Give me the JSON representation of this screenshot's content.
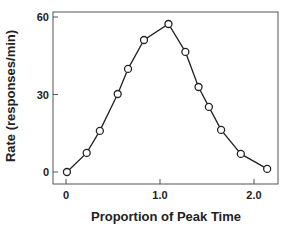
{
  "chart_data": {
    "type": "line",
    "title": "",
    "xlabel": "Proportion of Peak Time",
    "ylabel": "Rate (responses/min)",
    "xlim": [
      -0.14,
      2.27
    ],
    "ylim": [
      -4.6,
      61.9
    ],
    "xticks": [
      0,
      1.0,
      2.0
    ],
    "xtick_labels": [
      "0",
      "1.0",
      "2.0"
    ],
    "yticks": [
      0,
      30,
      60
    ],
    "ytick_labels": [
      "0",
      "30",
      "60"
    ],
    "grid": false,
    "legend": null,
    "series": [
      {
        "name": "Response rate",
        "marker": "open-circle",
        "color": "#222222",
        "x": [
          0.01,
          0.22,
          0.36,
          0.55,
          0.66,
          0.83,
          1.09,
          1.27,
          1.41,
          1.52,
          1.65,
          1.86,
          2.14
        ],
        "y": [
          0,
          7.4,
          15.9,
          30.2,
          39.9,
          51.1,
          57.3,
          46.5,
          32.9,
          25.2,
          16.3,
          7.0,
          1.2
        ]
      }
    ]
  },
  "layout": {
    "plot_left": 53,
    "plot_right": 278,
    "plot_top": 12,
    "plot_bottom": 184,
    "x0_px": 66,
    "x_px_per_unit": 94,
    "y0_px": 172,
    "y_px_per_unit": 2.583
  }
}
